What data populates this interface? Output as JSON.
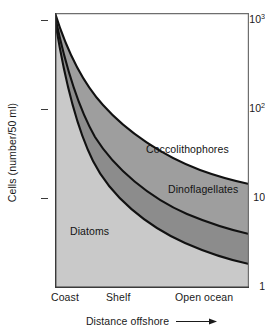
{
  "chart_data": {
    "type": "area",
    "stacked": true,
    "title": "",
    "subtitle": "",
    "xlabel": "Distance offshore",
    "ylabel": "Cells (number/50 ml)",
    "yscale": "log",
    "ylim": [
      1,
      1300
    ],
    "ytick_labels": [
      "10³",
      "10²",
      "10",
      "1"
    ],
    "ytick_values": [
      1000,
      100,
      10,
      1
    ],
    "xtick_labels": [
      "Coast",
      "Shelf",
      "Open ocean"
    ],
    "xtick_fractions": [
      0.0,
      0.28,
      0.72
    ],
    "grid": false,
    "legend": "in-plot labels",
    "xlabel_arrow": "rightward-arrow",
    "x_fractions": [
      0.0,
      0.08,
      0.16,
      0.25,
      0.35,
      0.5,
      0.65,
      0.8,
      1.0
    ],
    "series": [
      {
        "name": "Diatoms",
        "fill": "#c9c9c9",
        "boundary_note": "lowest band; upper boundary values below",
        "values": [
          1000,
          400,
          200,
          100,
          55,
          22,
          11,
          6,
          3.5
        ]
      },
      {
        "name": "Dinoflagellates",
        "fill": "#8c8c8c",
        "boundary_note": "middle band; cumulative upper boundary values",
        "values": [
          1100,
          560,
          330,
          190,
          115,
          55,
          33,
          21,
          13
        ]
      },
      {
        "name": "Coccolithophores",
        "fill": "#9e9e9e",
        "boundary_note": "upper band; cumulative upper boundary values",
        "values": [
          1200,
          750,
          500,
          330,
          220,
          120,
          78,
          54,
          38
        ]
      }
    ],
    "curve_color": "#111111",
    "axis_color": "#4a4a4a",
    "background": "#ffffff"
  },
  "axes": {
    "ylabel": "Cells (number/50 ml)",
    "xlabel": "Distance offshore",
    "yticks": [
      {
        "label_html": "10<sup>3</sup>",
        "value": 1000
      },
      {
        "label_html": "10<sup>2</sup>",
        "value": 100
      },
      {
        "label_html": "10",
        "value": 10
      },
      {
        "label_html": "1",
        "value": 1
      }
    ],
    "xticks": [
      {
        "label": "Coast"
      },
      {
        "label": "Shelf"
      },
      {
        "label": "Open ocean"
      }
    ]
  },
  "series_labels": {
    "coccolithophores": "Coccolithophores",
    "dinoflagellates": "Dinoflagellates",
    "diatoms": "Diatoms"
  }
}
